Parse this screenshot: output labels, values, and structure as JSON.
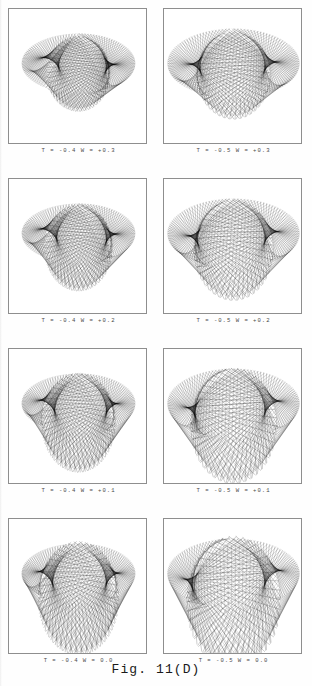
{
  "figure": {
    "caption": "Fig. 11(D)",
    "panel_columns": 2,
    "panel_rows": 4,
    "accent_color": "#000000",
    "frame_color": "#8e8e8e",
    "background_color": "#ffffff"
  },
  "panels": [
    {
      "id": "panel-r1c1",
      "caption": "T = -0.4   W = +0.3",
      "T": -0.4,
      "W": 0.3,
      "row": 1,
      "column": 1
    },
    {
      "id": "panel-r1c2",
      "caption": "T = -0.5   W = +0.3",
      "T": -0.5,
      "W": 0.3,
      "row": 1,
      "column": 2
    },
    {
      "id": "panel-r2c1",
      "caption": "T = -0.4   W = +0.2",
      "T": -0.4,
      "W": 0.2,
      "row": 2,
      "column": 1
    },
    {
      "id": "panel-r2c2",
      "caption": "T = -0.5   W = +0.2",
      "T": -0.5,
      "W": 0.2,
      "row": 2,
      "column": 2
    },
    {
      "id": "panel-r3c1",
      "caption": "T = -0.4   W = +0.1",
      "T": -0.4,
      "W": 0.1,
      "row": 3,
      "column": 1
    },
    {
      "id": "panel-r3c2",
      "caption": "T = -0.5   W = +0.1",
      "T": -0.5,
      "W": 0.1,
      "row": 3,
      "column": 2
    },
    {
      "id": "panel-r4c1",
      "caption": "T = -0.4   W =  0.0",
      "T": -0.4,
      "W": 0.0,
      "row": 4,
      "column": 1
    },
    {
      "id": "panel-r4c2",
      "caption": "T = -0.5   W =  0.0",
      "T": -0.5,
      "W": 0.0,
      "row": 4,
      "column": 2
    }
  ],
  "chart_data": {
    "type": "line",
    "title": "Fig. 11(D)",
    "subtitle": "Line-envelope (caustic) families for varying T and W",
    "xlabel": "",
    "ylabel": "",
    "grid": false,
    "legend": false,
    "xlim": [
      -1.0,
      1.0
    ],
    "ylim": [
      -1.0,
      1.0
    ],
    "series": [
      {
        "name": "T = -0.4, W = +0.3",
        "T": -0.4,
        "W": 0.3,
        "n_lines": 120,
        "param_range": [
          0.0,
          6.283185
        ],
        "tail_length": 0.3,
        "spread": 0.86
      },
      {
        "name": "T = -0.5, W = +0.3",
        "T": -0.5,
        "W": 0.3,
        "n_lines": 120,
        "param_range": [
          0.0,
          6.283185
        ],
        "tail_length": 0.3,
        "spread": 1.0
      },
      {
        "name": "T = -0.4, W = +0.2",
        "T": -0.4,
        "W": 0.2,
        "n_lines": 120,
        "param_range": [
          0.0,
          6.283185
        ],
        "tail_length": 0.42,
        "spread": 0.86
      },
      {
        "name": "T = -0.5, W = +0.2",
        "T": -0.5,
        "W": 0.2,
        "n_lines": 120,
        "param_range": [
          0.0,
          6.283185
        ],
        "tail_length": 0.42,
        "spread": 1.0
      },
      {
        "name": "T = -0.4, W = +0.1",
        "T": -0.4,
        "W": 0.1,
        "n_lines": 120,
        "param_range": [
          0.0,
          6.283185
        ],
        "tail_length": 0.56,
        "spread": 0.86
      },
      {
        "name": "T = -0.5, W = +0.1",
        "T": -0.5,
        "W": 0.1,
        "n_lines": 120,
        "param_range": [
          0.0,
          6.283185
        ],
        "tail_length": 0.56,
        "spread": 1.0
      },
      {
        "name": "T = -0.4, W = 0.0",
        "T": -0.4,
        "W": 0.0,
        "n_lines": 120,
        "param_range": [
          0.0,
          6.283185
        ],
        "tail_length": 0.72,
        "spread": 0.86
      },
      {
        "name": "T = -0.5, W = 0.0",
        "T": -0.5,
        "W": 0.0,
        "n_lines": 120,
        "param_range": [
          0.0,
          6.283185
        ],
        "tail_length": 0.72,
        "spread": 1.0
      }
    ]
  }
}
